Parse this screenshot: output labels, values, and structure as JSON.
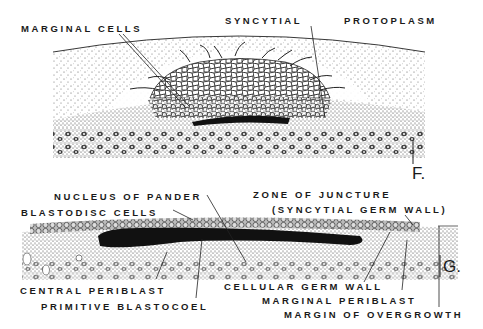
{
  "figure": {
    "panels": [
      {
        "id": "F",
        "label": "F.",
        "annotations": [
          {
            "key": "marginal_cells",
            "text": "MARGINAL CELLS"
          },
          {
            "key": "syncytial",
            "text": "SYNCYTIAL"
          },
          {
            "key": "protoplasm",
            "text": "PROTOPLASM"
          }
        ]
      },
      {
        "id": "G",
        "label": "G.",
        "annotations": [
          {
            "key": "nucleus_of_pander",
            "text": "NUCLEUS OF PANDER"
          },
          {
            "key": "blastodisc_cells",
            "text": "BLASTODISC CELLS"
          },
          {
            "key": "zone_of_juncture",
            "text": "ZONE OF JUNCTURE"
          },
          {
            "key": "syncytial_germ_wall",
            "text": "(SYNCYTIAL GERM WALL)"
          },
          {
            "key": "central_periblast",
            "text": "CENTRAL PERIBLAST"
          },
          {
            "key": "primitive_blastocoel",
            "text": "PRIMITIVE BLASTOCOEL"
          },
          {
            "key": "cellular_germ_wall",
            "text": "CELLULAR GERM WALL"
          },
          {
            "key": "marginal_periblast",
            "text": "MARGINAL PERIBLAST"
          },
          {
            "key": "margin_of_overgrowth",
            "text": "MARGIN OF OVERGROWTH"
          }
        ]
      }
    ],
    "colors": {
      "ink": "#1a1a1a",
      "paper": "#ffffff",
      "stipple": "#555555",
      "cavity": "#111111"
    }
  }
}
